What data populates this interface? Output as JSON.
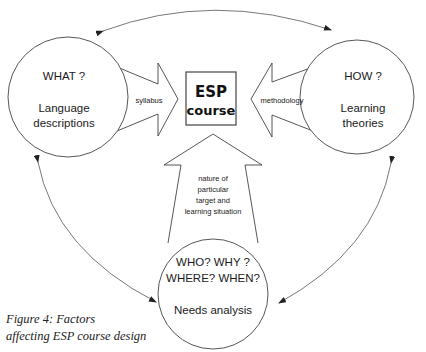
{
  "diagram": {
    "center_box": {
      "line1": "ESP",
      "line2": "course"
    },
    "nodes": [
      {
        "id": "what",
        "question": "WHAT ?",
        "label_line1": "Language",
        "label_line2": "descriptions"
      },
      {
        "id": "how",
        "question": "HOW ?",
        "label_line1": "Learning",
        "label_line2": "theories"
      },
      {
        "id": "who",
        "question_line1": "WHO? WHY ?",
        "question_line2": "WHERE? WHEN?",
        "label": "Needs analysis"
      }
    ],
    "arrows": {
      "left": "syllabus",
      "right": "methodology",
      "bottom_lines": [
        "nature of",
        "particular",
        "target and",
        "learning situation"
      ]
    },
    "connections": [
      {
        "from": "how",
        "to": "what",
        "type": "double-headed curved arrow"
      },
      {
        "from": "what",
        "to": "who",
        "type": "double-headed curved arrow"
      },
      {
        "from": "how",
        "to": "who",
        "type": "double-headed curved arrow"
      }
    ]
  },
  "caption": {
    "line1": "Figure 4: Factors",
    "line2": "affecting ESP course design"
  }
}
